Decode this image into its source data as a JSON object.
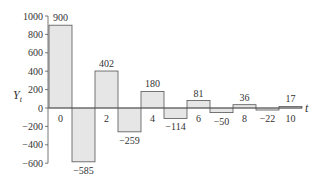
{
  "chart_data": {
    "type": "bar",
    "title": "",
    "xlabel": "t",
    "ylabel": "Y",
    "ylabel_subscript": "t",
    "x": [
      0,
      1,
      2,
      3,
      4,
      5,
      6,
      7,
      8,
      9,
      10
    ],
    "values": [
      900,
      -585,
      402,
      -259,
      180,
      -114,
      81,
      -50,
      36,
      -22,
      17
    ],
    "data_labels": [
      "900",
      "−585",
      "402",
      "−259",
      "180",
      "−114",
      "81",
      "−50",
      "36",
      "−22",
      "17"
    ],
    "x_tick_labels": [
      "0",
      "2",
      "4",
      "6",
      "8",
      "10"
    ],
    "x_tick_positions": [
      0,
      2,
      4,
      6,
      8,
      10
    ],
    "y_ticks": [
      1000,
      800,
      600,
      400,
      200,
      0,
      -200,
      -400,
      -600
    ],
    "y_tick_labels": [
      "1000",
      "800",
      "600",
      "400",
      "200",
      "0",
      "−200",
      "−400",
      "−600"
    ],
    "ylim": [
      -600,
      1000
    ],
    "grid": false,
    "legend": null,
    "bar_fill": "#e6e6e6",
    "bar_stroke": "#555555"
  }
}
